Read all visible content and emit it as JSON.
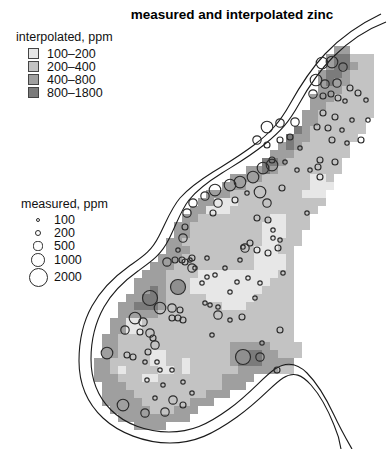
{
  "title": "measured and interpolated zinc",
  "legend_interpolated": {
    "title": "interpolated, ppm",
    "classes": [
      {
        "label": "100–200",
        "color": "#e7e7e7"
      },
      {
        "label": "200–400",
        "color": "#c3c3c3"
      },
      {
        "label": "400–800",
        "color": "#9f9f9f"
      },
      {
        "label": "800–1800",
        "color": "#7b7b7b"
      }
    ]
  },
  "legend_measured": {
    "title": "measured, ppm",
    "sizes": [
      {
        "label": "100",
        "radius": 2.2
      },
      {
        "label": "200",
        "radius": 3.2
      },
      {
        "label": "500",
        "radius": 4.6
      },
      {
        "label": "1000",
        "radius": 6.8
      },
      {
        "label": "2000",
        "radius": 9.5
      }
    ]
  },
  "chart_data": {
    "type": "heatmap",
    "title": "measured and interpolated zinc",
    "units": "ppm",
    "legend_position": "left",
    "interpolated_classes": [
      "100–200",
      "200–400",
      "400–800",
      "800–1800"
    ],
    "class_colors": [
      "#e7e7e7",
      "#c3c3c3",
      "#9f9f9f",
      "#7b7b7b"
    ],
    "measured_size_legend": [
      100,
      200,
      500,
      1000,
      2000
    ],
    "grid": {
      "origin_x": 78,
      "origin_y": 30,
      "cell": 8,
      "legend_for_chars": {
        "1": "100–200",
        "2": "200–400",
        "3": "400–800",
        "4": "800–1800"
      },
      "rows": [
        {
          "c": 0,
          "s": ""
        },
        {
          "c": 0,
          "s": ""
        },
        {
          "c": 32,
          "s": "33"
        },
        {
          "c": 31,
          "s": "344222"
        },
        {
          "c": 31,
          "s": "344322"
        },
        {
          "c": 30,
          "s": "3443222"
        },
        {
          "c": 30,
          "s": "3433222"
        },
        {
          "c": 30,
          "s": "3332222"
        },
        {
          "c": 29,
          "s": "33322222"
        },
        {
          "c": 29,
          "s": "33222222"
        },
        {
          "c": 28,
          "s": "332222222"
        },
        {
          "c": 28,
          "s": "33222222"
        },
        {
          "c": 27,
          "s": "432222222"
        },
        {
          "c": 26,
          "s": "433222222"
        },
        {
          "c": 25,
          "s": "343222222"
        },
        {
          "c": 24,
          "s": "3332222222"
        },
        {
          "c": 23,
          "s": "4432222222"
        },
        {
          "c": 21,
          "s": "334322222222"
        },
        {
          "c": 19,
          "s": "3333222222112"
        },
        {
          "c": 18,
          "s": "33322222222111"
        },
        {
          "c": 16,
          "s": "333222222222111"
        },
        {
          "c": 15,
          "s": "3311122222222222"
        },
        {
          "c": 14,
          "s": "3311122222222222"
        },
        {
          "c": 13,
          "s": "3322222222211222"
        },
        {
          "c": 12,
          "s": "33222222222111222"
        },
        {
          "c": 12,
          "s": "3322222222211122"
        },
        {
          "c": 11,
          "s": "33222222222211222"
        },
        {
          "c": 11,
          "s": "3332222222211122"
        },
        {
          "c": 10,
          "s": "33322222222211112"
        },
        {
          "c": 9,
          "s": "333222222222211112"
        },
        {
          "c": 8,
          "s": "3332222111111111122"
        },
        {
          "c": 7,
          "s": "33332221111111111222"
        },
        {
          "c": 7,
          "s": "33432221111111112222"
        },
        {
          "c": 6,
          "s": "334432222211111122222"
        },
        {
          "c": 5,
          "s": "3344432222222111222222"
        },
        {
          "c": 5,
          "s": "3333322222222222222222"
        },
        {
          "c": 4,
          "s": "33112222222222222222222"
        },
        {
          "c": 4,
          "s": "33112222222222222222222"
        },
        {
          "c": 3,
          "s": "332222222222222222222222"
        },
        {
          "c": 3,
          "s": "3322222222222222333332222"
        },
        {
          "c": 3,
          "s": "3322221122222222344433222"
        },
        {
          "c": 2,
          "s": "3322222112212222234443333"
        },
        {
          "c": 2,
          "s": "3321222211212222223333322"
        },
        {
          "c": 2,
          "s": "33322211222222223333"
        },
        {
          "c": 3,
          "s": "333222222222222333"
        },
        {
          "c": 3,
          "s": "3333222222222333"
        },
        {
          "c": 3,
          "s": "33333222222333"
        },
        {
          "c": 4,
          "s": "33333222333"
        },
        {
          "c": 5,
          "s": "333333333"
        },
        {
          "c": 7,
          "s": "3333"
        }
      ]
    },
    "river": {
      "stroke": "#1a1a1a",
      "bank_inner": "M386,22 C365,30 348,42 333,57 C318,72 309,86 299,104 C289,122 281,131 265,144 C249,157 238,163 222,173 C206,183 197,190 189,200 C181,210 177,223 169,239 C161,255 152,261 138,271 C124,281 113,291 104,307 C95,323 91,340 91,359 C91,379 97,396 111,410 C125,424 147,432 169,432 C191,432 207,425 229,409 C251,393 263,377 275,369 C287,361 297,363 307,373 C317,383 326,398 334,415 C341,430 348,442 352,449",
      "bank_outer": "M381,14 C360,24 341,37 325,54 C310,70 300,86 290,104 C280,122 270,133 254,145 C238,157 229,162 213,172 C197,182 188,189 180,198 C172,207 167,220 159,236 C151,252 142,257 128,267 C114,277 101,290 92,306 C83,322 79,340 79,361 C79,383 87,403 103,418 C119,433 145,443 170,443 C195,443 213,434 237,417 C261,400 272,385 283,378 C294,371 302,375 311,385 C320,395 328,410 334,425 C338,434 340,442 341,449"
    },
    "points_stroke": "#2b2b2b",
    "points_dark_fill": "#8f8f8f",
    "points_encoding": "[x, y, radius, dark?]",
    "points": [
      [
        322,
        63,
        5.8
      ],
      [
        332,
        62,
        5.8
      ],
      [
        343,
        67,
        4.2
      ],
      [
        316,
        80,
        5.8
      ],
      [
        325,
        84,
        4.2
      ],
      [
        337,
        83,
        4.2
      ],
      [
        350,
        88,
        3
      ],
      [
        313,
        94,
        4.2
      ],
      [
        323,
        96,
        3
      ],
      [
        331,
        94,
        3
      ],
      [
        338,
        98,
        3
      ],
      [
        345,
        101,
        2.2
      ],
      [
        358,
        93,
        3
      ],
      [
        366,
        100,
        2.2
      ],
      [
        323,
        113,
        3
      ],
      [
        335,
        117,
        3
      ],
      [
        352,
        120,
        2.2
      ],
      [
        317,
        127,
        3
      ],
      [
        328,
        128,
        3
      ],
      [
        342,
        130,
        2.2
      ],
      [
        332,
        140,
        3
      ],
      [
        347,
        143,
        2.2
      ],
      [
        361,
        140,
        3
      ],
      [
        368,
        120,
        2.2
      ],
      [
        295,
        122,
        4.2
      ],
      [
        267,
        127,
        5.8
      ],
      [
        280,
        123,
        4.2
      ],
      [
        257,
        140,
        4.2
      ],
      [
        267,
        145,
        3
      ],
      [
        280,
        140,
        3
      ],
      [
        290,
        137,
        3
      ],
      [
        300,
        148,
        2.2
      ],
      [
        272,
        160,
        3
      ],
      [
        285,
        162,
        2.2
      ],
      [
        297,
        170,
        2.2
      ],
      [
        320,
        160,
        3
      ],
      [
        335,
        162,
        3
      ],
      [
        310,
        170,
        2.2
      ],
      [
        320,
        177,
        3
      ],
      [
        318,
        167,
        3
      ],
      [
        272,
        165,
        5.8
      ],
      [
        263,
        168,
        5.8
      ],
      [
        253,
        177,
        5.8
      ],
      [
        240,
        182,
        5.8
      ],
      [
        230,
        185,
        5.8
      ],
      [
        215,
        190,
        5.8
      ],
      [
        205,
        196,
        4.2
      ],
      [
        193,
        203,
        4.2
      ],
      [
        187,
        213,
        4.2
      ],
      [
        185,
        227,
        3
      ],
      [
        183,
        238,
        4.2
      ],
      [
        178,
        250,
        2.2
      ],
      [
        182,
        260,
        3
      ],
      [
        190,
        260,
        2.2
      ],
      [
        195,
        268,
        2.2
      ],
      [
        218,
        203,
        4.2
      ],
      [
        213,
        213,
        3
      ],
      [
        235,
        200,
        3
      ],
      [
        247,
        193,
        2.2
      ],
      [
        260,
        192,
        5.8
      ],
      [
        267,
        203,
        4.2
      ],
      [
        268,
        220,
        3
      ],
      [
        257,
        218,
        3
      ],
      [
        250,
        243,
        3
      ],
      [
        245,
        248,
        4.2
      ],
      [
        257,
        250,
        3
      ],
      [
        240,
        260,
        2.2
      ],
      [
        282,
        188,
        3
      ],
      [
        307,
        213,
        2.2
      ],
      [
        273,
        230,
        2.2
      ],
      [
        280,
        240,
        2.2
      ],
      [
        167,
        262,
        4.2
      ],
      [
        175,
        260,
        3
      ],
      [
        185,
        262,
        3
      ],
      [
        192,
        268,
        4.2
      ],
      [
        178,
        287,
        7.5,
        1
      ],
      [
        150,
        298,
        7.5
      ],
      [
        160,
        308,
        5.8
      ],
      [
        172,
        308,
        4.2
      ],
      [
        180,
        310,
        3
      ],
      [
        135,
        318,
        5.8
      ],
      [
        143,
        322,
        4.2
      ],
      [
        172,
        318,
        3
      ],
      [
        178,
        318,
        3
      ],
      [
        183,
        320,
        3
      ],
      [
        125,
        330,
        4.2
      ],
      [
        140,
        332,
        3
      ],
      [
        150,
        333,
        4.2
      ],
      [
        153,
        338,
        3
      ],
      [
        155,
        345,
        4.2
      ],
      [
        107,
        353,
        5.8
      ],
      [
        127,
        355,
        3
      ],
      [
        133,
        357,
        3
      ],
      [
        148,
        352,
        3
      ],
      [
        145,
        362,
        2.2
      ],
      [
        157,
        362,
        2.2
      ],
      [
        192,
        258,
        3
      ],
      [
        207,
        258,
        2.2
      ],
      [
        225,
        268,
        2.2
      ],
      [
        215,
        275,
        2.2
      ],
      [
        207,
        277,
        2.2
      ],
      [
        202,
        283,
        2.2
      ],
      [
        237,
        282,
        2.2
      ],
      [
        248,
        278,
        2.2
      ],
      [
        260,
        283,
        2.2
      ],
      [
        230,
        292,
        2.2
      ],
      [
        255,
        298,
        2.2
      ],
      [
        205,
        303,
        2.2
      ],
      [
        210,
        305,
        2.2
      ],
      [
        218,
        307,
        2.2
      ],
      [
        218,
        315,
        4.2
      ],
      [
        230,
        320,
        2.2
      ],
      [
        242,
        317,
        3
      ],
      [
        212,
        335,
        2.2
      ],
      [
        243,
        247,
        2.2
      ],
      [
        268,
        253,
        3
      ],
      [
        278,
        248,
        3
      ],
      [
        273,
        238,
        2.2
      ],
      [
        283,
        273,
        2.2
      ],
      [
        280,
        330,
        3
      ],
      [
        262,
        343,
        2.2
      ],
      [
        243,
        357,
        7.5,
        1
      ],
      [
        260,
        357,
        4.2
      ],
      [
        277,
        370,
        3
      ],
      [
        123,
        405,
        5.8
      ],
      [
        145,
        413,
        4.2
      ],
      [
        165,
        412,
        4.2
      ],
      [
        173,
        400,
        4.2
      ],
      [
        183,
        405,
        3
      ],
      [
        155,
        398,
        2.2
      ],
      [
        147,
        380,
        2.2
      ],
      [
        163,
        385,
        2.2
      ],
      [
        183,
        382,
        2.2
      ],
      [
        192,
        393,
        2.2
      ],
      [
        160,
        370,
        2.2
      ],
      [
        172,
        370,
        2.2
      ]
    ]
  }
}
